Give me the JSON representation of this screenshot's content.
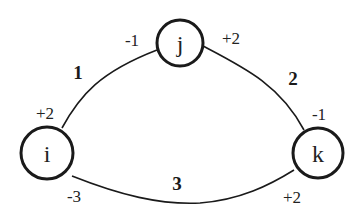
{
  "diagram": {
    "type": "graph",
    "nodes": [
      {
        "id": "i",
        "label": "i"
      },
      {
        "id": "j",
        "label": "j"
      },
      {
        "id": "k",
        "label": "k"
      }
    ],
    "edges": [
      {
        "from": "i",
        "to": "j",
        "weight": "1",
        "port_from": "+2",
        "port_to": "-1"
      },
      {
        "from": "j",
        "to": "k",
        "weight": "2",
        "port_from": "+2",
        "port_to": "-1"
      },
      {
        "from": "i",
        "to": "k",
        "weight": "3",
        "port_from": "-3",
        "port_to": "+2"
      }
    ]
  }
}
